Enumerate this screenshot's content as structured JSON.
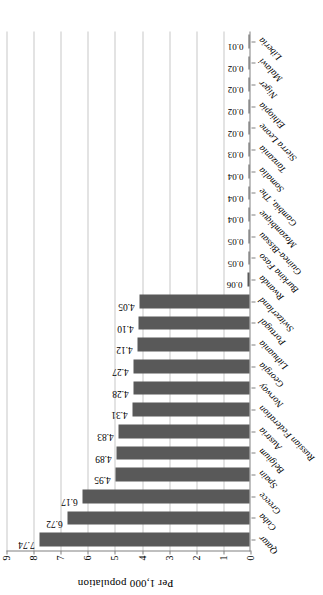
{
  "chart_data": {
    "type": "bar",
    "orientation": "vertical",
    "title": "",
    "xlabel": "",
    "ylabel": "Per 1,000 population",
    "ylim": [
      0,
      9
    ],
    "ytick_labels": [
      "0",
      "1",
      "2",
      "3",
      "4",
      "5",
      "6",
      "7",
      "8",
      "9"
    ],
    "ytick_values": [
      0,
      1,
      2,
      3,
      4,
      5,
      6,
      7,
      8,
      9
    ],
    "grid": true,
    "legend": false,
    "bar_color": "#595959",
    "categories": [
      "Qatar",
      "Cuba",
      "Greece",
      "Spain",
      "Belgium",
      "Austria",
      "Russian Federation",
      "Norway",
      "Georgia",
      "Lithuania",
      "Portugal",
      "Switzerland",
      "Rwanda",
      "Burkina Faso",
      "Guinea-Bissau",
      "Mozambique",
      "Gambia, The",
      "Somalia",
      "Tanzania",
      "Sierra Leone",
      "Ethiopia",
      "Niger",
      "Malawi",
      "Liberia"
    ],
    "values": [
      7.74,
      6.72,
      6.17,
      4.95,
      4.89,
      4.83,
      4.31,
      4.28,
      4.27,
      4.12,
      4.1,
      4.05,
      0.06,
      0.05,
      0.05,
      0.04,
      0.04,
      0.04,
      0.03,
      0.02,
      0.02,
      0.02,
      0.02,
      0.01
    ],
    "data_labels": [
      "7.74",
      "6.72",
      "6.17",
      "4.95",
      "4.89",
      "4.83",
      "4.31",
      "4.28",
      "4.27",
      "4.12",
      "4.10",
      "4.05",
      "0.06",
      "0.05",
      "0.05",
      "0.04",
      "0.04",
      "0.04",
      "0.03",
      "0.02",
      "0.02",
      "0.02",
      "0.02",
      "0.01"
    ]
  }
}
